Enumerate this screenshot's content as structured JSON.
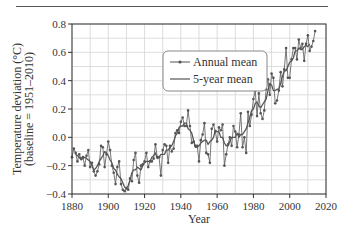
{
  "chart_data": {
    "type": "line",
    "title": "",
    "xlabel": "Year",
    "ylabel": "Temperature deviation (°C)",
    "ylabel_sub": "(baseline = 1951–2010)",
    "xlim": [
      1880,
      2020
    ],
    "ylim": [
      -0.4,
      0.8
    ],
    "x_ticks": [
      1880,
      1900,
      1920,
      1940,
      1960,
      1980,
      2000,
      2020
    ],
    "x_tick_labels": [
      "1880",
      "1900",
      "1920",
      "1940",
      "1960",
      "1980",
      "2000",
      "2020"
    ],
    "y_ticks": [
      -0.4,
      -0.2,
      0.0,
      0.2,
      0.4,
      0.6,
      0.8
    ],
    "y_tick_labels": [
      "−0.4",
      "−0.2",
      "0.0",
      "0.2",
      "0.4",
      "0.6",
      "0.8"
    ],
    "grid": true,
    "grid_minor_x_step": 10,
    "grid_minor_y_step": 0.1,
    "legend": {
      "position": "upper-center",
      "entries": [
        "Annual mean",
        "5-year mean"
      ]
    },
    "x": [
      1880,
      1881,
      1882,
      1883,
      1884,
      1885,
      1886,
      1887,
      1888,
      1889,
      1890,
      1891,
      1892,
      1893,
      1894,
      1895,
      1896,
      1897,
      1898,
      1899,
      1900,
      1901,
      1902,
      1903,
      1904,
      1905,
      1906,
      1907,
      1908,
      1909,
      1910,
      1911,
      1912,
      1913,
      1914,
      1915,
      1916,
      1917,
      1918,
      1919,
      1920,
      1921,
      1922,
      1923,
      1924,
      1925,
      1926,
      1927,
      1928,
      1929,
      1930,
      1931,
      1932,
      1933,
      1934,
      1935,
      1936,
      1937,
      1938,
      1939,
      1940,
      1941,
      1942,
      1943,
      1944,
      1945,
      1946,
      1947,
      1948,
      1949,
      1950,
      1951,
      1952,
      1953,
      1954,
      1955,
      1956,
      1957,
      1958,
      1959,
      1960,
      1961,
      1962,
      1963,
      1964,
      1965,
      1966,
      1967,
      1968,
      1969,
      1970,
      1971,
      1972,
      1973,
      1974,
      1975,
      1976,
      1977,
      1978,
      1979,
      1980,
      1981,
      1982,
      1983,
      1984,
      1985,
      1986,
      1987,
      1988,
      1989,
      1990,
      1991,
      1992,
      1993,
      1994,
      1995,
      1996,
      1997,
      1998,
      1999,
      2000,
      2001,
      2002,
      2003,
      2004,
      2005,
      2006,
      2007,
      2008,
      2009,
      2010,
      2011,
      2012,
      2013,
      2014
    ],
    "series": [
      {
        "name": "Annual mean",
        "values": [
          -0.14,
          -0.08,
          -0.11,
          -0.17,
          -0.12,
          -0.15,
          -0.14,
          -0.2,
          -0.13,
          -0.09,
          -0.21,
          -0.18,
          -0.24,
          -0.27,
          -0.24,
          -0.19,
          -0.06,
          -0.07,
          -0.21,
          -0.12,
          -0.03,
          -0.09,
          -0.2,
          -0.25,
          -0.33,
          -0.21,
          -0.17,
          -0.33,
          -0.37,
          -0.38,
          -0.36,
          -0.37,
          -0.29,
          -0.31,
          -0.16,
          -0.11,
          -0.27,
          -0.32,
          -0.2,
          -0.19,
          -0.17,
          -0.11,
          -0.21,
          -0.17,
          -0.17,
          -0.15,
          -0.05,
          -0.14,
          -0.14,
          -0.27,
          -0.09,
          -0.05,
          -0.06,
          -0.18,
          -0.06,
          -0.1,
          -0.08,
          0.03,
          0.05,
          0.03,
          0.11,
          0.14,
          0.08,
          0.08,
          0.19,
          0.08,
          -0.04,
          -0.03,
          -0.06,
          -0.06,
          -0.17,
          -0.02,
          0.02,
          0.1,
          -0.11,
          -0.12,
          -0.18,
          0.06,
          0.09,
          0.04,
          -0.03,
          0.07,
          0.05,
          0.09,
          -0.2,
          -0.12,
          -0.05,
          0.0,
          -0.06,
          0.08,
          0.04,
          -0.07,
          0.02,
          0.17,
          -0.07,
          0.0,
          -0.11,
          0.18,
          0.08,
          0.16,
          0.27,
          0.33,
          0.15,
          0.31,
          0.17,
          0.13,
          0.19,
          0.34,
          0.41,
          0.3,
          0.45,
          0.42,
          0.24,
          0.26,
          0.33,
          0.46,
          0.36,
          0.48,
          0.63,
          0.42,
          0.42,
          0.55,
          0.63,
          0.63,
          0.55,
          0.69,
          0.63,
          0.66,
          0.54,
          0.66,
          0.72,
          0.61,
          0.64,
          0.68,
          0.75
        ]
      },
      {
        "name": "5-year mean",
        "values": [
          null,
          null,
          -0.12,
          -0.13,
          -0.14,
          -0.16,
          -0.15,
          -0.14,
          -0.15,
          -0.16,
          -0.17,
          -0.2,
          -0.23,
          -0.22,
          -0.2,
          -0.17,
          -0.15,
          -0.13,
          -0.1,
          -0.11,
          -0.13,
          -0.16,
          -0.18,
          -0.22,
          -0.23,
          -0.26,
          -0.28,
          -0.29,
          -0.32,
          -0.35,
          -0.36,
          -0.34,
          -0.3,
          -0.25,
          -0.23,
          -0.23,
          -0.21,
          -0.22,
          -0.23,
          -0.2,
          -0.18,
          -0.17,
          -0.17,
          -0.17,
          -0.14,
          -0.13,
          -0.11,
          -0.15,
          -0.14,
          -0.12,
          -0.12,
          -0.12,
          -0.09,
          -0.09,
          -0.07,
          -0.06,
          -0.03,
          0.01,
          0.03,
          0.07,
          0.08,
          0.08,
          0.1,
          0.1,
          0.06,
          0.05,
          0.03,
          -0.02,
          -0.07,
          -0.07,
          -0.06,
          -0.04,
          -0.03,
          -0.02,
          -0.02,
          -0.05,
          -0.03,
          -0.02,
          0.0,
          0.05,
          0.04,
          0.04,
          0.0,
          0.0,
          -0.04,
          -0.06,
          -0.06,
          -0.03,
          0.0,
          0.0,
          0.0,
          0.03,
          0.0,
          0.02,
          0.02,
          0.04,
          0.06,
          0.1,
          0.14,
          0.19,
          0.2,
          0.24,
          0.25,
          0.22,
          0.21,
          0.23,
          0.25,
          0.27,
          0.33,
          0.38,
          0.37,
          0.33,
          0.33,
          0.34,
          0.34,
          0.38,
          0.43,
          0.47,
          0.47,
          0.5,
          0.53,
          0.54,
          0.56,
          0.61,
          0.61,
          0.63,
          0.62,
          0.62,
          0.64,
          0.65,
          0.64,
          0.66,
          null,
          null,
          null
        ]
      }
    ]
  },
  "header": {
    "has_top_rule": true
  },
  "colors": {
    "line": "#555555",
    "marker": "#555555",
    "grid": "#d4d4d4",
    "axis": "#333333",
    "legend_border": "#888888",
    "background": "#ffffff"
  }
}
